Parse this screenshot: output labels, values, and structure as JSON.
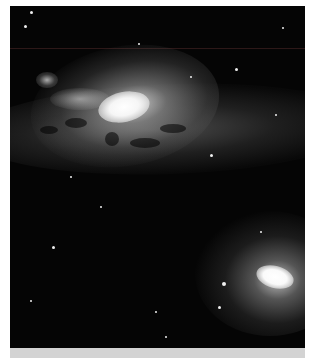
{
  "image": {
    "subject": "two elliptical galaxies with a dusty band across a star field",
    "alt": "Astronomical photograph of galaxies and stars",
    "colors": {
      "background": "#050505",
      "frame": "#ffffff",
      "bottom_bar": "#d3d3d3"
    }
  },
  "features": [
    {
      "name": "large-galaxy",
      "position": "upper-left center"
    },
    {
      "name": "dust-lane",
      "position": "middle band"
    },
    {
      "name": "elliptical-galaxy",
      "position": "lower right"
    },
    {
      "name": "small-galaxy",
      "position": "upper left"
    }
  ]
}
